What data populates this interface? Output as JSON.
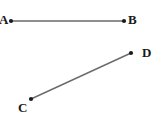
{
  "figure": {
    "width": 160,
    "height": 124,
    "background_color": "#ffffff",
    "line_color": "#6b6b6b",
    "point_color": "#1a1a1a",
    "label_color": "#1a1a1a",
    "line_width": 1.4,
    "point_radius": 2.1,
    "segments": [
      {
        "name": "segment-ab",
        "from": "A",
        "to": "B",
        "x1": 11,
        "y1": 21,
        "x2": 124,
        "y2": 21,
        "orientation": "horizontal"
      },
      {
        "name": "segment-cd",
        "from": "C",
        "to": "D",
        "x1": 31,
        "y1": 99,
        "x2": 131,
        "y2": 53,
        "orientation": "diagonal-up-right"
      }
    ],
    "points": [
      {
        "id": "A",
        "label": "A",
        "x": 11,
        "y": 21,
        "label_position": "left"
      },
      {
        "id": "B",
        "label": "B",
        "x": 124,
        "y": 21,
        "label_position": "right"
      },
      {
        "id": "C",
        "label": "C",
        "x": 31,
        "y": 99,
        "label_position": "below-left"
      },
      {
        "id": "D",
        "label": "D",
        "x": 131,
        "y": 53,
        "label_position": "right"
      }
    ]
  }
}
